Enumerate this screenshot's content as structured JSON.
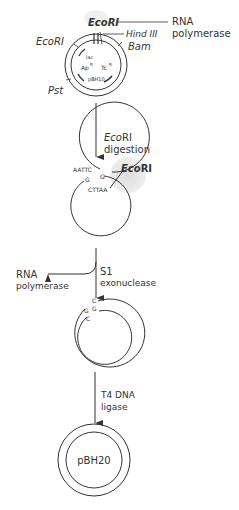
{
  "diagram": {
    "type": "plasmid-construction-flow",
    "stages": [
      {
        "id": "start",
        "plasmid": "pBH10",
        "labels": {
          "ecori_top": "EcoRI",
          "ecori_left": "EcoRI",
          "hind": "Hind III",
          "bam": "Bam",
          "pst": "Pst",
          "rna_pol": "RNA",
          "rna_pol2": "polymerase",
          "lac": "lac",
          "ap": "Ap",
          "ap_sup": "R",
          "tc": "Tc",
          "tc_sup": "R",
          "name": "pBH10"
        }
      },
      {
        "id": "step1",
        "arrow_label": [
          "EcoRI",
          "digestion"
        ],
        "labels": {
          "seq_top": "AATTC",
          "seq_g1": "G",
          "seq_g2": "G",
          "seq_bottom": "CTTAA",
          "ecori": "EcoRI"
        }
      },
      {
        "id": "step2",
        "arrow_label": [
          "S1",
          "exonuclease"
        ],
        "side_label": [
          "RNA",
          "polymerase"
        ],
        "labels": {
          "c1": "C",
          "g1": "G",
          "g2": "G",
          "c2": "C"
        }
      },
      {
        "id": "step3",
        "arrow_label": [
          "T4 DNA",
          "ligase"
        ],
        "plasmid": "pBH20"
      }
    ]
  },
  "text": {
    "s0_ecori_top": "EcoRI",
    "s0_ecori_left": "EcoRI",
    "s0_hind": "Hind III",
    "s0_bam": "Bam",
    "s0_pst": "Pst",
    "s0_rna1": "RNA",
    "s0_rna2": "polymerase",
    "s0_lac": "lac",
    "s0_ap": "Ap",
    "s0_tc": "Tc",
    "s0_sup": "R",
    "s0_name": "pBH10",
    "a1_l1_it": "Eco",
    "a1_l1": "RI",
    "a1_l2": "digestion",
    "s1_aattc": "AATTC",
    "s1_g": "G",
    "s1_ctaa": "CTTAA",
    "s1_eco": "Eco",
    "s1_ri": "RI",
    "a2_l1": "S1",
    "a2_l2": "exonuclease",
    "a2_side1": "RNA",
    "a2_side2": "polymerase",
    "s2_c": "C",
    "s2_g": "G",
    "a3_l1": "T4 DNA",
    "a3_l2": "ligase",
    "s3_name": "pBH20"
  }
}
